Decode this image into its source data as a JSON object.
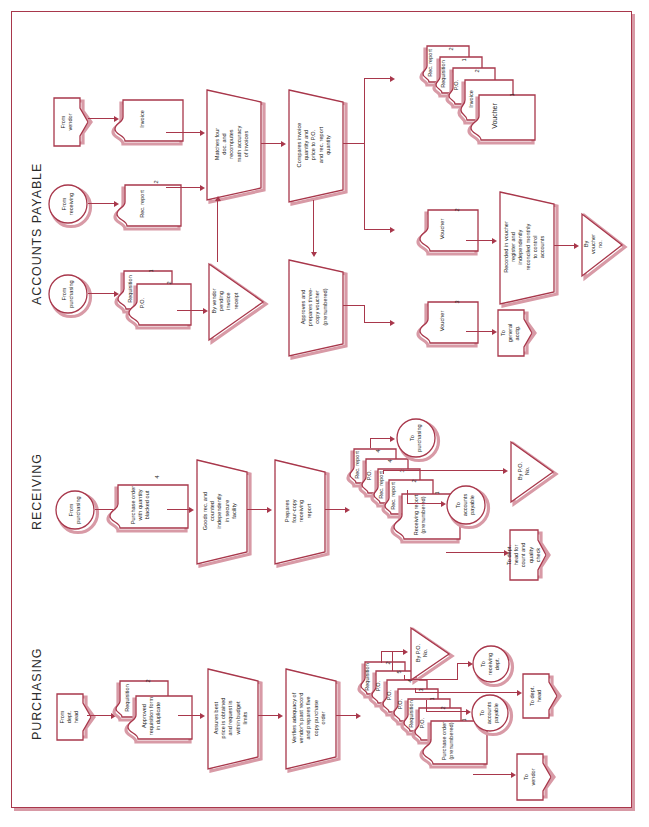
{
  "figure": {
    "orientation": "rotated-90-ccw",
    "colors": {
      "line": "#a8374b",
      "shadow": "#d89aa6",
      "text": "#1d1d1d",
      "background": "#ffffff"
    }
  },
  "sections": [
    {
      "id": "accounts_payable",
      "label": "ACCOUNTS PAYABLE"
    },
    {
      "id": "receiving",
      "label": "RECEIVING"
    },
    {
      "id": "purchasing",
      "label": "PURCHASING"
    }
  ],
  "accounts_payable": {
    "offpage_from_vendor": "From\nvendor",
    "conn_from_receiving": "From\nreceiving",
    "conn_from_purchasing": "From\npurchasing",
    "doc_invoice": "Invoice",
    "doc_rec_report": "Rec. report",
    "doc_rec_report_num": "2",
    "doc_requisition": "Requisition",
    "doc_requisition_num": "1",
    "doc_po": "P.O.",
    "doc_po_num": "2",
    "proc_matches": "Matches four\ndoc. and\nrecomputes\nmath accuracy\nof invoices",
    "file_by_vendor": "By vendor\npending\ninvoice\nreceipt",
    "proc_compares": "Compares invoice\nquantity and\nprice to P.O.\nand rec. report\nquantity",
    "proc_approves": "Approves and\nprepares three-\ncopy voucher\n(prenumbered)",
    "stack": [
      {
        "label": "Rec. report",
        "num": "2"
      },
      {
        "label": "Requisition",
        "num": "1"
      },
      {
        "label": "P.O.",
        "num": "2"
      },
      {
        "label": "Invoice",
        "num": ""
      },
      {
        "label": "Voucher",
        "num": "1"
      }
    ],
    "doc_voucher2": "Voucher",
    "doc_voucher2_num": "2",
    "doc_voucher3": "Voucher",
    "doc_voucher3_num": "3",
    "proc_recorded": "Recorded in voucher\nregister and\nindependently\nreconciled monthly\nto control\naccounts",
    "file_by_voucher_no": "By\nvoucher\nno.",
    "offpage_to_general_acctg": "To\ngeneral\nacctg."
  },
  "receiving": {
    "conn_from_purchasing": "From\npurchasing",
    "doc_purchase_order": "Purchase order\nwith quantity\nblacked out",
    "doc_purchase_order_num": "4",
    "proc_goods_rec": "Goods rec. and\ncounted\nindependently\nin secure\nfacility",
    "proc_prepares": "Prepares\nfour-copy\nreceiving\nreport",
    "stack": [
      {
        "label": "Rec. report",
        "num": "4"
      },
      {
        "label": "P.O.",
        "num": "4"
      },
      {
        "label": "Rec. report",
        "num": "3"
      },
      {
        "label": "Rec. report",
        "num": "2"
      },
      {
        "label": "Receiving report\n(prenumbered)",
        "num": "1"
      }
    ],
    "conn_to_purchasing": "To\npurchasing",
    "conn_to_accounts_payable": "To\naccounts\npayable",
    "file_by_po_no": "By P.O.\nNo.",
    "offpage_to_dept_head": "To dept.\nhead for\ncount and\nquality\ncheck"
  },
  "purchasing": {
    "offpage_from_dept_head": "From\ndept.\nhead",
    "doc_requisition": "Requisition",
    "doc_requisition_num": "2",
    "doc_approved_req": "Approved\nrequisition form\nin duplicate",
    "proc_assures": "Assures best\nprice is obtained\nand request is\nwithin budget\nlimits",
    "proc_verifies": "Verifies adequacy of\nvendor's past record\nand prepares five\ncopy purchase\norder",
    "stack": [
      {
        "label": "Requisition",
        "num": "2"
      },
      {
        "label": "P.O.",
        "num": "5"
      },
      {
        "label": "P.O.",
        "num": "4"
      },
      {
        "label": "P.O.",
        "num": "3"
      },
      {
        "label": "Requisition",
        "num": "1"
      },
      {
        "label": "P.O.",
        "num": "2"
      },
      {
        "label": "Purchase order\n(prenumbered)",
        "num": "1"
      }
    ],
    "file_by_po_no": "By P.O.\nNo.",
    "conn_to_receiving_dept": "To\nreceiving\ndept.",
    "conn_to_accounts_payable": "To\naccounts\npayable",
    "offpage_to_dept_head": "To dept.\nhead",
    "offpage_to_vendor": "To\nvendor"
  }
}
